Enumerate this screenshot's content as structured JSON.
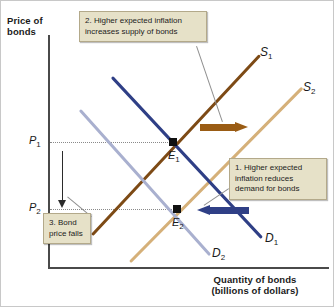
{
  "figure": {
    "type": "supply-demand-diagram",
    "y_axis_label": "Price of\nbonds",
    "y_axis_label_line1": "Price of",
    "y_axis_label_line2": "bonds",
    "x_axis_label_line1": "Quantity of bonds",
    "x_axis_label_line2": "(billions of dollars)"
  },
  "price_levels": [
    {
      "id": "P1",
      "label": "P",
      "sub": "1"
    },
    {
      "id": "P2",
      "label": "P",
      "sub": "2"
    }
  ],
  "curves": [
    {
      "id": "S1",
      "label": "S",
      "sub": "1",
      "color": "#7d4a15",
      "kind": "supply",
      "state": "original"
    },
    {
      "id": "S2",
      "label": "S",
      "sub": "2",
      "color": "#d5b079",
      "kind": "supply",
      "state": "shifted"
    },
    {
      "id": "D1",
      "label": "D",
      "sub": "1",
      "color": "#2f3f86",
      "kind": "demand",
      "state": "original"
    },
    {
      "id": "D2",
      "label": "D",
      "sub": "2",
      "color": "#a9b0cf",
      "kind": "demand",
      "state": "shifted"
    }
  ],
  "equilibria": [
    {
      "id": "E1",
      "label": "E",
      "sub": "1"
    },
    {
      "id": "E2",
      "label": "E",
      "sub": "2"
    }
  ],
  "callouts": [
    {
      "id": "demand",
      "text": "1. Higher expected inflation reduces demand for bonds"
    },
    {
      "id": "supply",
      "text": "2. Higher expected inflation increases supply of bonds"
    },
    {
      "id": "price",
      "text": "3. Bond price falls"
    }
  ],
  "shift_arrows": [
    {
      "id": "supply-shift",
      "direction": "right",
      "color": "#9a5c14"
    },
    {
      "id": "demand-shift",
      "direction": "left",
      "color": "#2f3f86"
    },
    {
      "id": "price-fall",
      "direction": "down",
      "color": "#2b2b2b"
    }
  ],
  "chart_data": {
    "type": "line",
    "title": "",
    "xlabel": "Quantity of bonds (billions of dollars)",
    "ylabel": "Price of bonds",
    "grid": false,
    "legend": "inline-curve-labels",
    "series": [
      {
        "name": "S1",
        "kind": "supply",
        "slope": "positive",
        "points": [
          [
            90,
            235
          ],
          [
            258,
            55
          ]
        ]
      },
      {
        "name": "S2",
        "kind": "supply",
        "slope": "positive",
        "points": [
          [
            128,
            262
          ],
          [
            300,
            88
          ]
        ]
      },
      {
        "name": "D1",
        "kind": "demand",
        "slope": "negative",
        "points": [
          [
            112,
            77
          ],
          [
            262,
            238
          ]
        ]
      },
      {
        "name": "D2",
        "kind": "demand",
        "slope": "negative",
        "points": [
          [
            80,
            110
          ],
          [
            210,
            255
          ]
        ]
      }
    ],
    "annotated_points": [
      {
        "name": "E1",
        "price": "P1",
        "curves": [
          "S1",
          "D1"
        ]
      },
      {
        "name": "E2",
        "price": "P2",
        "curves": [
          "S2",
          "D2"
        ]
      }
    ],
    "ylim": [
      "P2",
      "P1"
    ],
    "note": "Higher expected inflation shifts supply right and demand left, lowering bond price from P1 to P2."
  }
}
